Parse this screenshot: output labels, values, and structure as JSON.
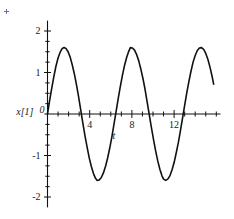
{
  "chart_data": {
    "type": "line",
    "title": "",
    "xlabel": "t",
    "ylabel": "x[1]",
    "xlim": [
      -0.3,
      16.4
    ],
    "ylim": [
      -2.25,
      2.25
    ],
    "grid": false,
    "legend": null,
    "origin_label": "0",
    "x_ticks_major": [
      4,
      8,
      12
    ],
    "x_tick_labels": [
      "4",
      "8",
      "12"
    ],
    "x_ticks_minor": [
      1,
      2,
      3,
      5,
      6,
      7,
      9,
      10,
      11,
      13,
      14,
      15,
      16
    ],
    "y_ticks_major": [
      2,
      1,
      -1,
      -2
    ],
    "y_tick_labels": [
      "2",
      "1",
      "-1",
      "-2"
    ],
    "y_ticks_minor": [
      1.75,
      1.5,
      1.25,
      0.75,
      0.5,
      0.25,
      -0.25,
      -0.5,
      -0.75,
      -1.25,
      -1.5,
      -1.75
    ],
    "series": [
      {
        "name": "x[1]",
        "color": "#111111",
        "line_width": 1.6,
        "function": "1.6*sin(2*pi*t/6.283)",
        "amplitude": 1.6,
        "period": 6.283,
        "phase": 0,
        "x_start": 0,
        "x_end": 15.75,
        "peaks_x": [
          1.57,
          7.85
        ],
        "peaks_y": [
          1.6,
          1.6
        ],
        "troughs_x": [
          4.71,
          11.0
        ],
        "troughs_y": [
          -1.6,
          -1.6
        ],
        "zero_crossings": [
          0,
          3.14,
          6.28,
          9.42,
          12.57
        ],
        "points": [
          [
            0.0,
            0.0
          ],
          [
            0.2,
            0.32
          ],
          [
            0.4,
            0.62
          ],
          [
            0.6,
            0.9
          ],
          [
            0.8,
            1.15
          ],
          [
            1.0,
            1.35
          ],
          [
            1.2,
            1.49
          ],
          [
            1.4,
            1.58
          ],
          [
            1.57,
            1.6
          ],
          [
            1.75,
            1.58
          ],
          [
            1.95,
            1.5
          ],
          [
            2.15,
            1.37
          ],
          [
            2.35,
            1.18
          ],
          [
            2.55,
            0.96
          ],
          [
            2.75,
            0.7
          ],
          [
            2.95,
            0.41
          ],
          [
            3.14,
            0.11
          ],
          [
            3.35,
            -0.22
          ],
          [
            3.55,
            -0.52
          ],
          [
            3.75,
            -0.79
          ],
          [
            3.95,
            -1.05
          ],
          [
            4.15,
            -1.26
          ],
          [
            4.35,
            -1.43
          ],
          [
            4.55,
            -1.55
          ],
          [
            4.71,
            -1.6
          ],
          [
            4.9,
            -1.59
          ],
          [
            5.1,
            -1.53
          ],
          [
            5.3,
            -1.42
          ],
          [
            5.5,
            -1.26
          ],
          [
            5.7,
            -1.06
          ],
          [
            5.9,
            -0.82
          ],
          [
            6.1,
            -0.55
          ],
          [
            6.28,
            -0.28
          ],
          [
            6.5,
            0.06
          ],
          [
            6.7,
            0.37
          ],
          [
            6.9,
            0.66
          ],
          [
            7.1,
            0.93
          ],
          [
            7.3,
            1.17
          ],
          [
            7.5,
            1.36
          ],
          [
            7.7,
            1.51
          ],
          [
            7.85,
            1.6
          ],
          [
            8.05,
            1.59
          ],
          [
            8.25,
            1.54
          ],
          [
            8.45,
            1.43
          ],
          [
            8.65,
            1.28
          ],
          [
            8.85,
            1.08
          ],
          [
            9.05,
            0.85
          ],
          [
            9.25,
            0.59
          ],
          [
            9.42,
            0.33
          ],
          [
            9.65,
            -0.02
          ],
          [
            9.85,
            -0.33
          ],
          [
            10.05,
            -0.62
          ],
          [
            10.25,
            -0.89
          ],
          [
            10.45,
            -1.13
          ],
          [
            10.65,
            -1.33
          ],
          [
            10.85,
            -1.49
          ],
          [
            11.0,
            -1.57
          ],
          [
            11.2,
            -1.6
          ],
          [
            11.4,
            -1.57
          ],
          [
            11.6,
            -1.49
          ],
          [
            11.8,
            -1.35
          ],
          [
            12.0,
            -1.17
          ],
          [
            12.2,
            -0.94
          ],
          [
            12.4,
            -0.69
          ],
          [
            12.57,
            -0.45
          ],
          [
            12.8,
            -0.1
          ],
          [
            13.0,
            0.21
          ],
          [
            13.2,
            0.51
          ],
          [
            13.4,
            0.78
          ],
          [
            13.6,
            1.03
          ],
          [
            13.8,
            1.25
          ],
          [
            14.0,
            1.41
          ],
          [
            14.2,
            1.53
          ],
          [
            14.4,
            1.59
          ],
          [
            14.6,
            1.6
          ],
          [
            14.8,
            1.56
          ],
          [
            15.0,
            1.46
          ],
          [
            15.2,
            1.32
          ],
          [
            15.4,
            1.13
          ],
          [
            15.6,
            0.91
          ],
          [
            15.75,
            0.72
          ]
        ]
      }
    ]
  },
  "axes": {
    "x_axis_name": "t",
    "y_axis_name": "x[1]",
    "origin": "0",
    "axis_color": "#111111"
  },
  "marks": {
    "corner_mark_color": "#6a6ab4"
  }
}
